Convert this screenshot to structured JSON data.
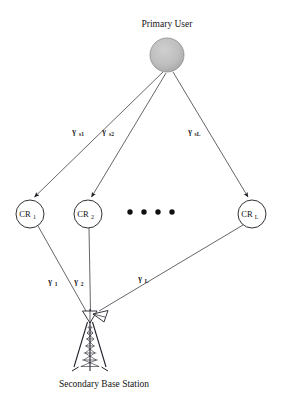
{
  "diagram": {
    "background_color": "#ffffff",
    "line_color": "#4a4a52",
    "node_stroke_color": "#1c1c1c",
    "primary_user_fill": "#b9b9b9"
  },
  "primary_user": {
    "label": "Primary User",
    "node_name": "primary-user-node",
    "cx": 167,
    "cy": 55,
    "r": 17,
    "label_x": 167,
    "label_y": 27
  },
  "cognitive_radios": [
    {
      "label": "CR",
      "subscript": "1",
      "cx": 30,
      "cy": 214,
      "r": 14,
      "name": "cr-node-1"
    },
    {
      "label": "CR",
      "subscript": "2",
      "cx": 88,
      "cy": 214,
      "r": 14,
      "name": "cr-node-2"
    },
    {
      "label": "CR",
      "subscript": "L",
      "cx": 252,
      "cy": 214,
      "r": 14,
      "name": "cr-node-L"
    }
  ],
  "ellipsis": {
    "name": "ellipsis-dots",
    "count": 4,
    "y": 212,
    "x_positions": [
      130,
      144,
      158,
      172
    ],
    "r": 2.7
  },
  "base_station": {
    "label": "Secondary Base Station",
    "name": "secondary-base-station",
    "x": 90,
    "y": 312,
    "label_x": 104,
    "label_y": 385
  },
  "uplink_edges": [
    {
      "name": "edge-pu-to-cr1",
      "from": "primary-user",
      "to": "cr-node-1",
      "x1": 163,
      "y1": 72,
      "x2": 34,
      "y2": 198,
      "label": "γ",
      "sublabel": "s1",
      "label_x": 74,
      "label_y": 133
    },
    {
      "name": "edge-pu-to-cr2",
      "from": "primary-user",
      "to": "cr-node-2",
      "x1": 166,
      "y1": 73,
      "x2": 92,
      "y2": 198,
      "label": "γ",
      "sublabel": "s2",
      "label_x": 104,
      "label_y": 133
    },
    {
      "name": "edge-pu-to-crL",
      "from": "primary-user",
      "to": "cr-node-L",
      "x1": 173,
      "y1": 72,
      "x2": 248,
      "y2": 198,
      "label": "γ",
      "sublabel": "sL",
      "label_x": 190,
      "label_y": 133
    }
  ],
  "downlink_edges": [
    {
      "name": "edge-cr1-to-bs",
      "from": "cr-node-1",
      "to": "secondary-base-station",
      "x1": 38,
      "y1": 226,
      "x2": 86,
      "y2": 311,
      "label": "γ",
      "sublabel": "1",
      "label_x": 50,
      "label_y": 283
    },
    {
      "name": "edge-cr2-to-bs",
      "from": "cr-node-2",
      "to": "secondary-base-station",
      "x1": 89,
      "y1": 228,
      "x2": 90,
      "y2": 311,
      "label": "γ",
      "sublabel": "2",
      "label_x": 76,
      "label_y": 283
    },
    {
      "name": "edge-crL-to-bs",
      "from": "cr-node-L",
      "to": "secondary-base-station",
      "x1": 243,
      "y1": 225,
      "x2": 98,
      "y2": 311,
      "label": "γ",
      "sublabel": "L",
      "label_x": 140,
      "label_y": 280
    }
  ]
}
